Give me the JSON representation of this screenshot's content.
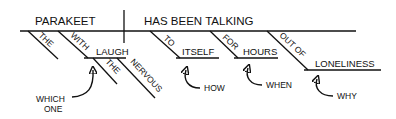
{
  "diagram": {
    "type": "sentence-diagram",
    "subject": "PARAKEET",
    "predicate": "HAS BEEN TALKING",
    "subject_modifiers": {
      "article": "THE",
      "prep_phrase": {
        "preposition": "WITH",
        "object": "LAUGH",
        "object_modifiers": [
          "THE",
          "NERVOUS"
        ],
        "annotation": "WHICH ONE"
      }
    },
    "predicate_modifiers": [
      {
        "preposition": "TO",
        "object": "ITSELF",
        "annotation": "HOW"
      },
      {
        "preposition": "FOR",
        "object": "HOURS",
        "annotation": "WHEN"
      },
      {
        "preposition": "OUT OF",
        "object": "LONELINESS",
        "annotation": "WHY"
      }
    ]
  }
}
